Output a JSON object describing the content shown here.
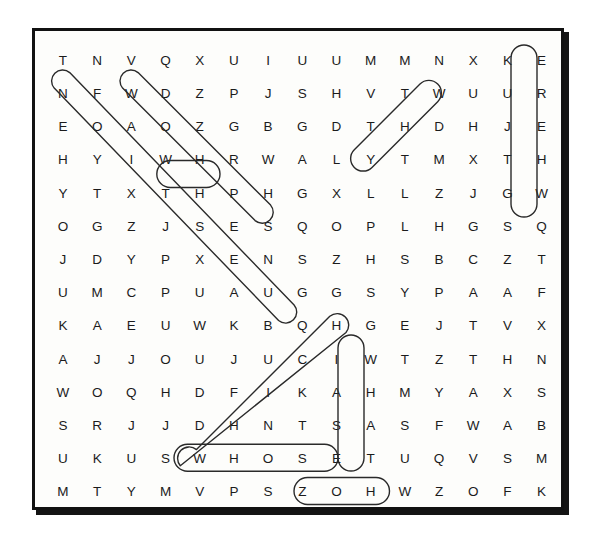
{
  "puzzle": {
    "title": "Word Search Puzzle",
    "rows": 14,
    "cols": 15,
    "grid": [
      [
        "T",
        "N",
        "V",
        "Q",
        "X",
        "U",
        "I",
        "U",
        "U",
        "M",
        "M",
        "N",
        "X",
        "K",
        "E"
      ],
      [
        "N",
        "F",
        "W",
        "D",
        "Z",
        "P",
        "J",
        "S",
        "H",
        "V",
        "T",
        "W",
        "U",
        "U",
        "R"
      ],
      [
        "E",
        "O",
        "A",
        "O",
        "Z",
        "G",
        "B",
        "G",
        "D",
        "T",
        "H",
        "D",
        "H",
        "J",
        "E"
      ],
      [
        "H",
        "Y",
        "I",
        "W",
        "H",
        "R",
        "W",
        "A",
        "L",
        "Y",
        "T",
        "M",
        "X",
        "T",
        "H"
      ],
      [
        "Y",
        "T",
        "X",
        "T",
        "H",
        "P",
        "H",
        "G",
        "X",
        "L",
        "L",
        "Z",
        "J",
        "G",
        "W"
      ],
      [
        "O",
        "G",
        "Z",
        "J",
        "S",
        "E",
        "S",
        "Q",
        "O",
        "P",
        "L",
        "H",
        "G",
        "S",
        "Q"
      ],
      [
        "J",
        "D",
        "Y",
        "P",
        "X",
        "E",
        "N",
        "S",
        "Z",
        "H",
        "S",
        "B",
        "C",
        "Z",
        "T"
      ],
      [
        "U",
        "M",
        "C",
        "P",
        "U",
        "A",
        "U",
        "G",
        "G",
        "S",
        "Y",
        "P",
        "A",
        "A",
        "F"
      ],
      [
        "K",
        "A",
        "E",
        "U",
        "W",
        "K",
        "B",
        "Q",
        "H",
        "G",
        "E",
        "J",
        "T",
        "V",
        "X"
      ],
      [
        "A",
        "J",
        "J",
        "O",
        "U",
        "J",
        "U",
        "C",
        "I",
        "W",
        "T",
        "Z",
        "T",
        "H",
        "N"
      ],
      [
        "W",
        "O",
        "Q",
        "H",
        "D",
        "F",
        "I",
        "K",
        "A",
        "H",
        "M",
        "Y",
        "A",
        "X",
        "S"
      ],
      [
        "S",
        "R",
        "J",
        "J",
        "D",
        "H",
        "N",
        "T",
        "S",
        "A",
        "S",
        "F",
        "W",
        "A",
        "B"
      ],
      [
        "U",
        "K",
        "U",
        "S",
        "W",
        "H",
        "O",
        "S",
        "E",
        "T",
        "U",
        "Q",
        "V",
        "S",
        "M"
      ],
      [
        "M",
        "T",
        "Y",
        "M",
        "V",
        "P",
        "S",
        "Z",
        "O",
        "H",
        "W",
        "Z",
        "O",
        "F",
        "K"
      ]
    ],
    "found_words": [
      {
        "word": "QUESTION",
        "direction": "diagonal-up-right-reversed",
        "start_row": 2,
        "start_col": 1,
        "end_row": 9,
        "end_col": 8,
        "letters": "N O I T S E U Q"
      },
      {
        "word": "WHO",
        "direction": "diagonal-down-right",
        "start_row": 2,
        "start_col": 3,
        "end_row": 7,
        "end_col": 7,
        "letters": "W O H T S E N"
      },
      {
        "word": "WH",
        "direction": "horizontal",
        "start_row": 4,
        "start_col": 4,
        "end_row": 4,
        "end_col": 5,
        "letters": "W H"
      },
      {
        "word": "WHY",
        "direction": "diagonal-down-left-reversed",
        "start_row": 2,
        "start_col": 12,
        "end_row": 4,
        "end_col": 10,
        "letters": "W H Y"
      },
      {
        "word": "WHERE",
        "direction": "vertical-reversed",
        "start_row": 1,
        "start_col": 15,
        "end_row": 5,
        "end_col": 15,
        "letters": "E R E H W"
      },
      {
        "word": "WHICH",
        "direction": "diagonal-up-right",
        "start_row": 13,
        "start_col": 5,
        "end_row": 9,
        "end_col": 9,
        "letters": "W H I C H"
      },
      {
        "word": "WHOSE",
        "direction": "horizontal",
        "start_row": 13,
        "start_col": 5,
        "end_row": 13,
        "end_col": 9,
        "letters": "W H O S E"
      },
      {
        "word": "WHAT",
        "direction": "vertical",
        "start_row": 10,
        "start_col": 10,
        "end_row": 13,
        "end_col": 10,
        "letters": "W H A T"
      },
      {
        "word": "WHO",
        "direction": "horizontal",
        "start_row": 14,
        "start_col": 9,
        "end_row": 14,
        "end_col": 11,
        "letters": "O H W"
      }
    ],
    "colors": {
      "border": "#111111",
      "letter": "#1b1b1b",
      "circle_stroke": "#2a2a2a",
      "background": "#ffffff"
    }
  }
}
